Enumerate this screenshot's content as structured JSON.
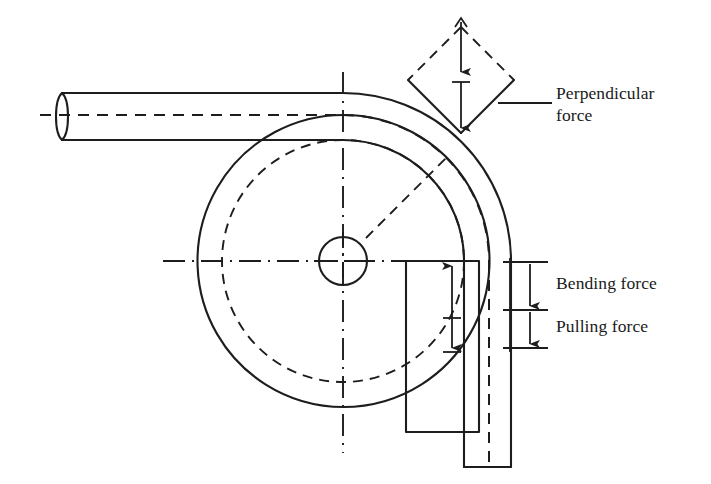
{
  "figure": {
    "background_color": "#ffffff",
    "line_color": "#1d1d1d"
  },
  "labels": {
    "perpendicular_force": "Perpendicular\nforce",
    "perpendicular_force_line1": "Perpendicular",
    "perpendicular_force_line2": "force",
    "bending_force": "Bending force",
    "pulling_force": "Pulling force"
  },
  "parts": {
    "tube": "tube-workpiece",
    "bend_die": "bend-die-circle",
    "inner_die_circle": "inner-die-dashed-circle",
    "center_hole": "die-center-hole",
    "clamp_block": "clamp-die-block",
    "pressure_arrow_diamond": "perpendicular-force-diamond",
    "centerlines": "axis-centerlines"
  },
  "geometry": {
    "die_center_x": 343,
    "die_center_y": 261,
    "die_outer_radius": 146,
    "die_inner_radius": 121,
    "center_hole_radius": 24,
    "tube_centerline_y": 115,
    "tube_centerline_x": 465,
    "tube_outer_top_y": 93,
    "tube_outer_bottom_y": 140
  },
  "arrows": {
    "perpendicular": {
      "name": "perpendicular-force-arrow",
      "direction": "down",
      "double_headed": true
    },
    "bending": {
      "name": "bending-force-arrow",
      "direction": "up-down",
      "double_headed": true
    },
    "pulling": {
      "name": "pulling-force-arrow",
      "direction": "down",
      "double_headed": false
    }
  }
}
